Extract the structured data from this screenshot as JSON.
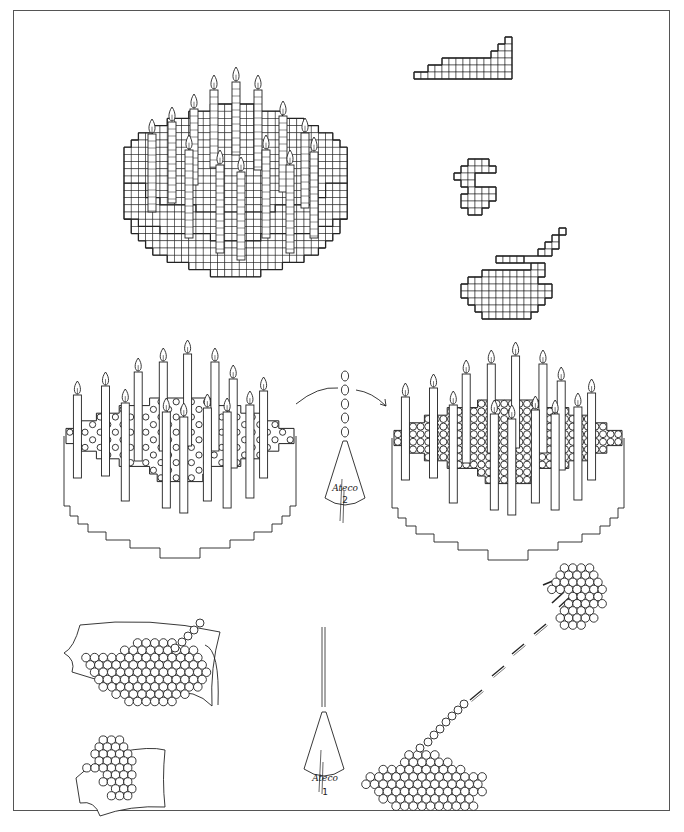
{
  "figure": {
    "type": "instructional-illustration",
    "stroke_color": "#222222",
    "frame_color": "#555555",
    "background": "#ffffff"
  },
  "panels": {
    "grid_cake": {
      "candles_back_row": 9,
      "candles_front_row": 7,
      "description": "Grid pattern of round cake with 16 candles"
    },
    "grid_shapes": {
      "items": [
        "staircase strip",
        "crescent / pac-man shape",
        "blob with diagonal stem"
      ]
    },
    "dotted_cake_before": {
      "label": "Sparse dots pattern",
      "candles": 16
    },
    "dotted_cake_after": {
      "label": "Dense dots pattern",
      "candles": 16
    },
    "piping_tube_2": {
      "brand": "Ateco",
      "number": "2",
      "dots_shown": 5
    },
    "piping_tube_1": {
      "brand": "Ateco",
      "number": "1"
    },
    "fabric_pieces": {
      "count": 2,
      "description": "Dot patterns draped on cloth"
    },
    "transfer": {
      "description": "Dotted blob linked by dashed line to dotted crescent with splash marks"
    }
  }
}
